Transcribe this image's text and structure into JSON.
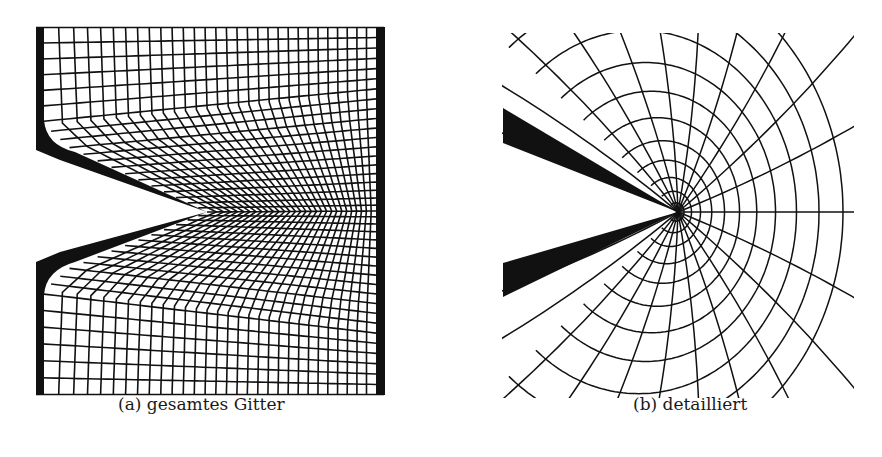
{
  "figure": {
    "panels": [
      {
        "id": "a",
        "label": "(a)",
        "caption": "(a) gesamtes Gitter",
        "content": "full structured mesh around V-notch"
      },
      {
        "id": "b",
        "label": "(b)",
        "caption": "(b) detailliert",
        "content": "detailed mesh near notch tip"
      }
    ]
  },
  "colors": {
    "ink": "#111111",
    "paper": "#ffffff"
  }
}
